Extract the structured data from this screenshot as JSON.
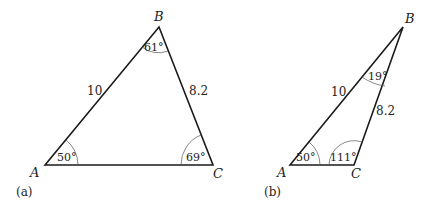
{
  "diagram": {
    "panels": [
      {
        "caption": "(a)",
        "vertices": {
          "A": "A",
          "B": "B",
          "C": "C"
        },
        "sides": {
          "AB": "10",
          "BC": "8.2"
        },
        "angles": {
          "A": "50°",
          "B": "61°",
          "C": "69°"
        }
      },
      {
        "caption": "(b)",
        "vertices": {
          "A": "A",
          "B": "B",
          "C": "C"
        },
        "sides": {
          "AB": "10",
          "BC": "8.2"
        },
        "angles": {
          "A": "50°",
          "B": "19°",
          "C": "111°"
        }
      }
    ],
    "colors": {
      "stroke": "#1a1a1a",
      "text": "#222222",
      "arc": "#555555"
    }
  }
}
